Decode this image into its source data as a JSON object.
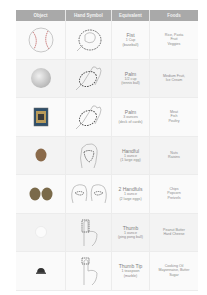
{
  "table": {
    "headers": [
      "Object",
      "Hand Symbol",
      "Equivalent",
      "Foods"
    ],
    "header_color": "#a9a9a9",
    "rows": [
      {
        "object_icon": "baseball-icon",
        "hand_icon": "fist-icon",
        "equivalent": "Fist",
        "amount": "1 Cup",
        "example": "(baseball)",
        "foods": [
          "Rice, Pasta",
          "Fruit",
          "Veggies"
        ]
      },
      {
        "object_icon": "tennis-ball-icon",
        "hand_icon": "palm-icon",
        "equivalent": "Palm",
        "amount": "1/2 cup",
        "example": "(tennis ball)",
        "foods": [
          "Medium Fruit,",
          "Ice Cream"
        ]
      },
      {
        "object_icon": "deck-of-cards-icon",
        "hand_icon": "palm-icon",
        "equivalent": "Palm",
        "amount": "3 ounces",
        "example": "(deck of cards)",
        "foods": [
          "Meat",
          "Fish",
          "Poultry"
        ]
      },
      {
        "object_icon": "egg-icon",
        "hand_icon": "handful-icon",
        "equivalent": "Handful",
        "amount": "1 ounce",
        "example": "(1 large egg)",
        "foods": [
          "Nuts",
          "Raisins"
        ]
      },
      {
        "object_icon": "two-eggs-icon",
        "hand_icon": "two-handfuls-icon",
        "equivalent": "2 Handfuls",
        "amount": "1 ounce",
        "example": "(2 large eggs)",
        "foods": [
          "Chips",
          "Popcorn",
          "Pretzels"
        ]
      },
      {
        "object_icon": "ping-pong-ball-icon",
        "hand_icon": "thumb-icon",
        "equivalent": "Thumb",
        "amount": "1 ounce",
        "example": "(ping pong ball)",
        "foods": [
          "Peanut Butter",
          "Hard Cheese"
        ]
      },
      {
        "object_icon": "marble-icon",
        "hand_icon": "thumb-tip-icon",
        "equivalent": "Thumb Tip",
        "amount": "1 teaspoon",
        "example": "(marble)",
        "foods": [
          "Cooking Oil",
          "Mayonnaise, Butter",
          "Sugar"
        ]
      }
    ]
  }
}
